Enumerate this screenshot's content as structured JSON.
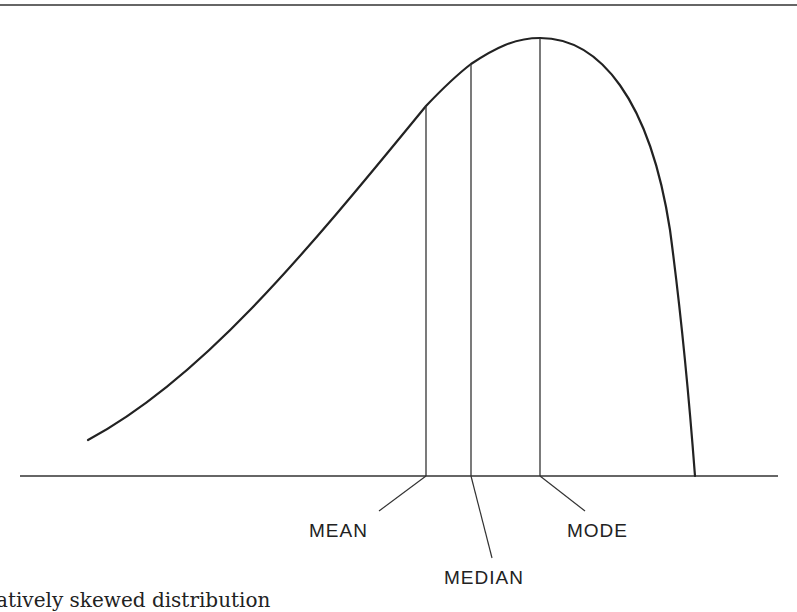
{
  "figure": {
    "labels": {
      "mean": "MEAN",
      "median": "MEDIAN",
      "mode": "MODE"
    },
    "caption": "atively skewed distribution",
    "colors": {
      "ink": "#222222",
      "background": "#ffffff"
    }
  },
  "geometry": {
    "baseline_y": 476,
    "curve_path": "M 88 440 C 200 380, 300 260, 426 106 C 445 86, 458 74, 471 64 C 495 48, 515 38, 540 38 C 600 38, 650 100, 670 230 C 682 320, 690 410, 695 476",
    "verticals": {
      "mean_x": 426,
      "median_x": 471,
      "mode_x": 540
    }
  }
}
